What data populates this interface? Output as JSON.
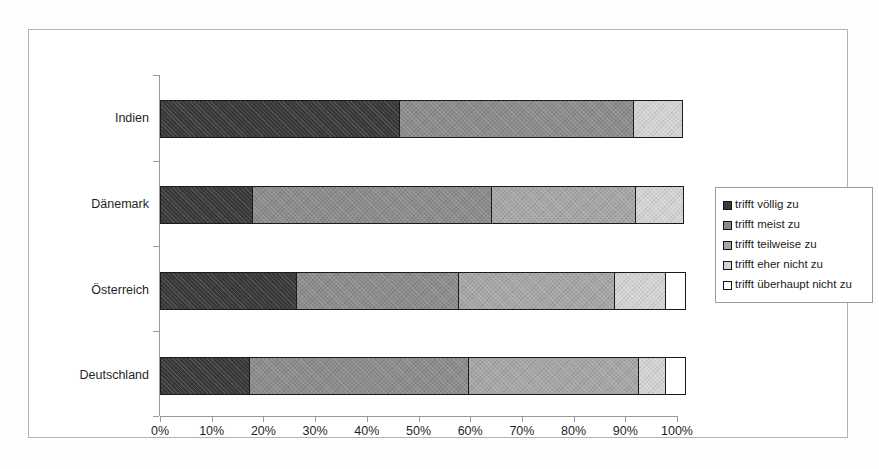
{
  "chart_data": {
    "type": "bar",
    "subtype": "stacked-horizontal-100-percent",
    "title": "",
    "xlabel": "",
    "ylabel": "",
    "categories": [
      "Indien",
      "Dänemark",
      "Österreich",
      "Deutschland"
    ],
    "series": [
      {
        "name": "trifft völlig zu",
        "color": "#3a3a3a",
        "values": [
          46.0,
          17.6,
          26.0,
          17.0
        ]
      },
      {
        "name": "trifft meist zu",
        "color": "#8c8c8c",
        "values": [
          45.0,
          45.9,
          31.0,
          42.0
        ]
      },
      {
        "name": "trifft teilweise zu",
        "color": "#a6a6a6",
        "values": [
          0.0,
          27.5,
          30.0,
          32.5
        ]
      },
      {
        "name": "trifft eher nicht zu",
        "color": "#d4d4d4",
        "values": [
          9.0,
          9.0,
          9.5,
          5.0
        ]
      },
      {
        "name": "trifft überhaupt nicht zu",
        "color": "#ffffff",
        "values": [
          0.0,
          0.0,
          3.5,
          3.5
        ]
      }
    ],
    "xticks": [
      "0%",
      "10%",
      "20%",
      "30%",
      "40%",
      "50%",
      "60%",
      "70%",
      "80%",
      "90%",
      "100%"
    ],
    "xtick_values": [
      0,
      10,
      20,
      30,
      40,
      50,
      60,
      70,
      80,
      90,
      100
    ],
    "xlim": [
      0,
      100
    ],
    "grid": false,
    "legend_position": "right",
    "legend_entries": [
      "trifft völlig zu",
      "trifft meist zu",
      "trifft teilweise zu",
      "trifft eher nicht zu",
      "trifft überhaupt nicht zu"
    ]
  },
  "colors": {
    "segment_1": "#3a3a3a",
    "segment_2": "#8c8c8c",
    "segment_3": "#a6a6a6",
    "segment_4": "#d4d4d4",
    "segment_5": "#ffffff",
    "outline": "#1b1b1b",
    "axis": "#9a9a9a",
    "frame": "#b3b3b3",
    "text": "#1f1f1f",
    "background": "#ffffff"
  }
}
